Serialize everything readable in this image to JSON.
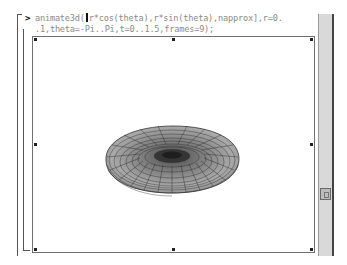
{
  "worksheet": {
    "prompt_symbol": ">",
    "command_line1_before_cursor": "animate3d(",
    "command_line1_after_cursor": "r*cos(theta),r*sin(theta),napprox],r=0.",
    "command_line2": ".1,theta=-Pi..Pi,t=0..1.5,frames=9);"
  },
  "plot": {
    "type": "3d-animation-frame",
    "description": "toroidal wireframe surface (grey mesh)",
    "frame_color": "#707070",
    "surface_color": "#8c8c8c",
    "mesh_color": "#2a2a2a"
  },
  "scrollbar": {
    "orientation": "vertical",
    "thumb_position_pct": 72
  }
}
